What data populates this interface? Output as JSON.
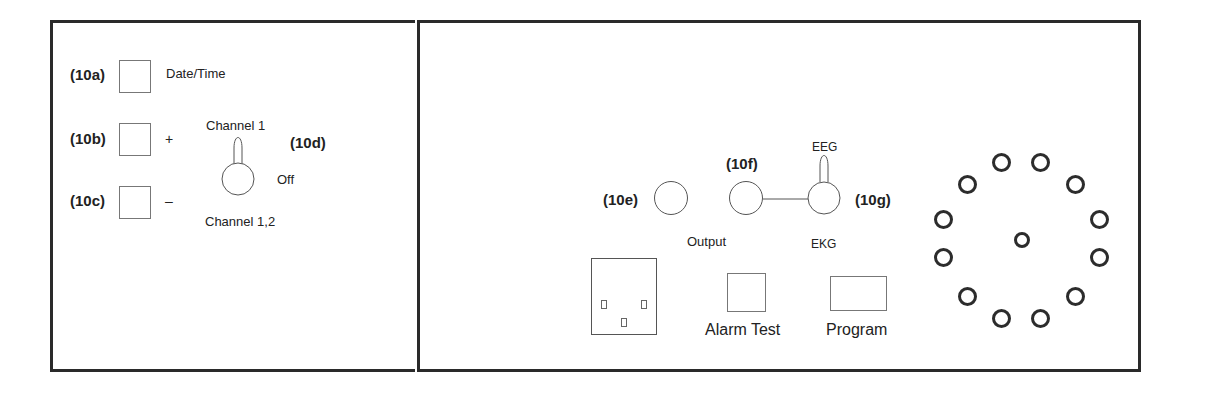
{
  "left_panel": {
    "buttons": [
      {
        "ref": "(10a)",
        "label": "Date/Time"
      },
      {
        "ref": "(10b)",
        "label": "+"
      },
      {
        "ref": "(10c)",
        "label": "–"
      }
    ],
    "channel_switch": {
      "ref": "(10d)",
      "top_label": "Channel 1",
      "right_label": "Off",
      "bottom_label": "Channel 1,2"
    }
  },
  "right_panel": {
    "knob_e": {
      "ref": "(10e)"
    },
    "knob_f": {
      "ref": "(10f)",
      "label": "Output"
    },
    "switch_g": {
      "ref": "(10g)",
      "top_label": "EEG",
      "bottom_label": "EKG"
    },
    "alarm_test": {
      "label": "Alarm Test"
    },
    "program": {
      "label": "Program"
    },
    "connector": {
      "pins": 12,
      "center_pin": 1
    }
  },
  "colors": {
    "border": "#2a2a2a",
    "line": "#555555",
    "text": "#222222"
  }
}
